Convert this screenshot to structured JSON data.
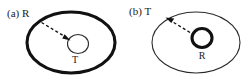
{
  "figure": {
    "background_color": "#ffffff",
    "ink_color": "#111111",
    "panels": [
      {
        "tag": "(a)",
        "outer_label": "R",
        "outer_label_text": "(a)  R",
        "outer_style": "thick",
        "outer_meaning": "receiver",
        "inner_label": "T",
        "inner_style": "thin",
        "inner_meaning": "transmitter",
        "arrow_direction": "inward",
        "arrow_from": "outer-ellipse-upper-left-rim",
        "arrow_to": "inner-circle"
      },
      {
        "tag": "(b)",
        "outer_label": "T",
        "outer_label_text": "(b)  T",
        "outer_style": "thin",
        "outer_meaning": "transmitter",
        "inner_label": "R",
        "inner_style": "thick",
        "inner_meaning": "receiver",
        "arrow_direction": "outward",
        "arrow_from": "inner-circle",
        "arrow_to": "outer-ellipse-upper-left-rim"
      }
    ]
  }
}
